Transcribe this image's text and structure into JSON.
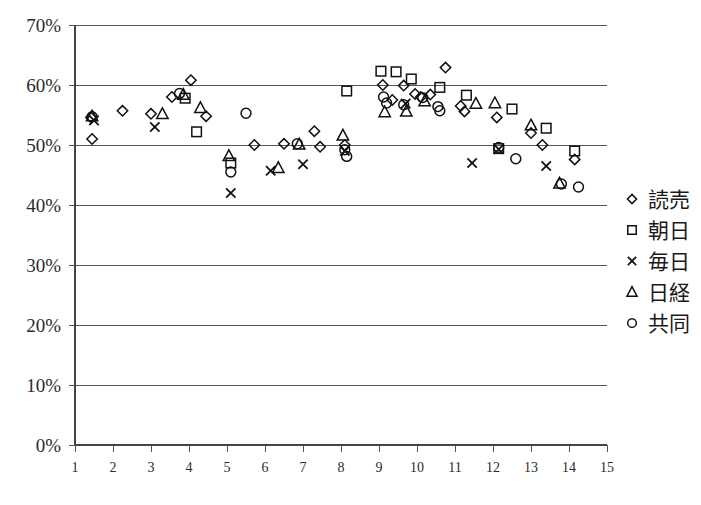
{
  "chart_data": {
    "type": "scatter",
    "title": "",
    "xlabel": "",
    "ylabel": "",
    "xlim": [
      1,
      15
    ],
    "ylim": [
      0,
      0.7
    ],
    "grid": true,
    "legend_position": "right",
    "xticks": [
      "1",
      "2",
      "3",
      "4",
      "5",
      "6",
      "7",
      "8",
      "9",
      "10",
      "11",
      "12",
      "13",
      "14",
      "15"
    ],
    "yticks": [
      "0%",
      "10%",
      "20%",
      "30%",
      "40%",
      "50%",
      "60%",
      "70%"
    ],
    "ytick_values": [
      0,
      10,
      20,
      30,
      40,
      50,
      60,
      70
    ],
    "series": [
      {
        "name": "読売",
        "marker": "diamond",
        "points": [
          [
            1.42,
            54.6
          ],
          [
            1.45,
            51.0
          ],
          [
            2.25,
            55.7
          ],
          [
            3.0,
            55.2
          ],
          [
            3.55,
            58.0
          ],
          [
            4.05,
            60.8
          ],
          [
            4.45,
            54.8
          ],
          [
            5.72,
            50.0
          ],
          [
            6.5,
            50.2
          ],
          [
            7.3,
            52.3
          ],
          [
            7.45,
            49.7
          ],
          [
            8.1,
            50.0
          ],
          [
            9.1,
            60.0
          ],
          [
            9.35,
            57.5
          ],
          [
            9.65,
            59.9
          ],
          [
            9.95,
            58.5
          ],
          [
            10.1,
            58.0
          ],
          [
            10.35,
            58.4
          ],
          [
            10.75,
            62.9
          ],
          [
            11.15,
            56.5
          ],
          [
            11.25,
            55.6
          ],
          [
            12.1,
            54.6
          ],
          [
            13.0,
            52.0
          ],
          [
            13.3,
            50.0
          ],
          [
            14.15,
            47.6
          ]
        ]
      },
      {
        "name": "朝日",
        "marker": "square",
        "points": [
          [
            3.9,
            57.8
          ],
          [
            4.2,
            52.2
          ],
          [
            5.1,
            47.0
          ],
          [
            8.15,
            59.0
          ],
          [
            9.05,
            62.3
          ],
          [
            9.45,
            62.2
          ],
          [
            9.85,
            61.0
          ],
          [
            10.6,
            59.6
          ],
          [
            11.3,
            58.3
          ],
          [
            12.15,
            49.4
          ],
          [
            12.5,
            56.0
          ],
          [
            13.4,
            52.8
          ],
          [
            14.15,
            49.0
          ]
        ]
      },
      {
        "name": "毎日",
        "marker": "x",
        "points": [
          [
            1.5,
            54.1
          ],
          [
            3.1,
            53.0
          ],
          [
            5.1,
            42.0
          ],
          [
            6.15,
            45.7
          ],
          [
            7.0,
            46.8
          ],
          [
            8.1,
            49.0
          ],
          [
            9.7,
            56.9
          ],
          [
            11.45,
            47.0
          ],
          [
            12.15,
            49.3
          ],
          [
            13.4,
            46.5
          ]
        ]
      },
      {
        "name": "日経",
        "marker": "triangle",
        "points": [
          [
            1.45,
            54.8
          ],
          [
            3.3,
            55.2
          ],
          [
            3.85,
            58.4
          ],
          [
            4.3,
            56.2
          ],
          [
            5.05,
            48.2
          ],
          [
            6.35,
            46.2
          ],
          [
            6.9,
            50.1
          ],
          [
            8.05,
            51.6
          ],
          [
            9.15,
            55.5
          ],
          [
            9.72,
            55.6
          ],
          [
            10.2,
            57.3
          ],
          [
            11.55,
            56.9
          ],
          [
            12.05,
            57.0
          ],
          [
            13.0,
            53.3
          ],
          [
            13.75,
            43.6
          ]
        ]
      },
      {
        "name": "共同",
        "marker": "circle",
        "points": [
          [
            1.45,
            54.7
          ],
          [
            3.75,
            58.6
          ],
          [
            5.1,
            45.5
          ],
          [
            5.5,
            55.3
          ],
          [
            6.85,
            50.2
          ],
          [
            8.1,
            49.2
          ],
          [
            8.15,
            48.1
          ],
          [
            9.12,
            58.0
          ],
          [
            9.2,
            57.0
          ],
          [
            9.65,
            56.7
          ],
          [
            10.15,
            57.9
          ],
          [
            10.55,
            56.4
          ],
          [
            10.6,
            55.7
          ],
          [
            12.15,
            49.6
          ],
          [
            12.6,
            47.7
          ],
          [
            13.8,
            43.5
          ],
          [
            14.25,
            43.0
          ]
        ]
      }
    ]
  },
  "legend": {
    "entries": [
      {
        "label": "読売",
        "marker": "diamond"
      },
      {
        "label": "朝日",
        "marker": "square"
      },
      {
        "label": "毎日",
        "marker": "x"
      },
      {
        "label": "日経",
        "marker": "triangle"
      },
      {
        "label": "共同",
        "marker": "circle"
      }
    ]
  }
}
